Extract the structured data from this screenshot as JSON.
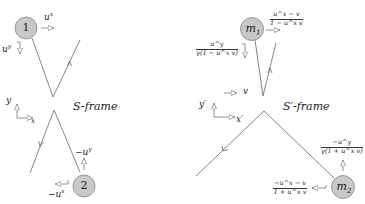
{
  "left_diagram": {
    "frame_label": "S-frame",
    "ball1": {
      "label": "1",
      "vx_label": "u",
      "vx_sup": "x",
      "vy_label": "u",
      "vy_sup": "y"
    },
    "ball2": {
      "label": "2",
      "vx_label": "−u",
      "vx_sup": "x",
      "vy_label": "−u",
      "vy_sup": "y"
    },
    "axes": {
      "y": "y",
      "x": "x"
    }
  },
  "right_diagram": {
    "frame_label": "S′-frame",
    "ball1": {
      "label": "m",
      "label_sub": "1",
      "vx_num": "u^x − v",
      "vx_den": "1 − u^x v",
      "vy_num": "u^y",
      "vy_den": "γ(1 − u^x v)"
    },
    "ball2": {
      "label": "m",
      "label_sub": "2",
      "vx_num": "−u^x − v",
      "vx_den": "1 + u^x v",
      "vy_num": "−u^y",
      "vy_den": "γ(1 + u^x v)"
    },
    "axes": {
      "y": "y′",
      "x": "x′",
      "boost": "v"
    }
  },
  "colors": {
    "ball_fill": "#c8c8c8",
    "ball_stroke": "#777777",
    "line": "#555555",
    "arrow": "#666666"
  }
}
